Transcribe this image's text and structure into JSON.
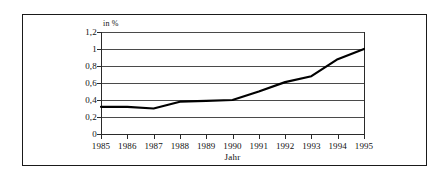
{
  "chart_data": {
    "type": "line",
    "title": "",
    "xlabel": "Jahr",
    "ylabel": "in %",
    "y_unit_label": "in %",
    "categories": [
      "1985",
      "1986",
      "1987",
      "1988",
      "1989",
      "1990",
      "1991",
      "1992",
      "1993",
      "1994",
      "1995"
    ],
    "x": [
      1985,
      1986,
      1987,
      1988,
      1989,
      1990,
      1991,
      1992,
      1993,
      1994,
      1995
    ],
    "values": [
      0.32,
      0.32,
      0.3,
      0.38,
      0.39,
      0.4,
      0.5,
      0.61,
      0.68,
      0.88,
      1.0
    ],
    "series": [
      {
        "name": "",
        "values": [
          0.32,
          0.32,
          0.3,
          0.38,
          0.39,
          0.4,
          0.5,
          0.61,
          0.68,
          0.88,
          1.0
        ]
      }
    ],
    "ylim": [
      0,
      1.2
    ],
    "xlim": [
      1985,
      1995
    ],
    "yticks": [
      0,
      0.2,
      0.4,
      0.6,
      0.8,
      1.0,
      1.2
    ],
    "ytick_labels": [
      "0",
      "0,2",
      "0,4",
      "0,6",
      "0,8",
      "1",
      "1,2"
    ],
    "xtick_labels": [
      "1985",
      "1986",
      "1987",
      "1988",
      "1989",
      "1990",
      "1991",
      "1992",
      "1993",
      "1994",
      "1995"
    ],
    "grid": true,
    "grid_axis": "y",
    "legend": false,
    "legend_position": "none",
    "markers": false,
    "line_color": "#000000",
    "gridline_color": "#4a4a4a",
    "axis_color": "#2a2a2a",
    "background_color": "#ffffff",
    "frame_border_color": "#1a1a1a"
  },
  "figure": {
    "x_axis_title": "Jahr",
    "y_axis_unit": "in %"
  }
}
